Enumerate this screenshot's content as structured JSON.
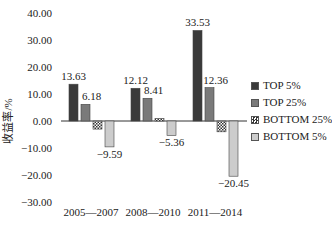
{
  "chart_data": {
    "type": "bar",
    "title": "",
    "xlabel": "",
    "ylabel": "收益率/%",
    "ylim": [
      -30,
      40
    ],
    "yticks": [
      "40.00",
      "30.00",
      "20.00",
      "10.00",
      "0.00",
      "-10.00",
      "-20.00",
      "-30.00"
    ],
    "grid": false,
    "legend_position": "right",
    "categories": [
      "2005—2007",
      "2008—2010",
      "2011—2014"
    ],
    "series": [
      {
        "name": "TOP 5%",
        "values": [
          13.63,
          12.12,
          33.53
        ],
        "labels": [
          "13.63",
          "12.12",
          "33.53"
        ],
        "color": "#3a3a3a",
        "pattern": "solid"
      },
      {
        "name": "TOP 25%",
        "values": [
          6.18,
          8.41,
          12.36
        ],
        "labels": [
          "6.18",
          "8.41",
          "12.36"
        ],
        "color": "#7a7a7a",
        "pattern": "solid"
      },
      {
        "name": "BOTTOM 25%",
        "values": [
          -3.0,
          1.0,
          -4.0
        ],
        "labels": [
          "",
          "",
          ""
        ],
        "color": "#ffffff",
        "pattern": "checker"
      },
      {
        "name": "BOTTOM 5%",
        "values": [
          -9.59,
          -5.36,
          -20.45
        ],
        "labels": [
          "−9.59",
          "−5.36",
          "−20.45"
        ],
        "color": "#cccccc",
        "pattern": "solid"
      }
    ]
  }
}
